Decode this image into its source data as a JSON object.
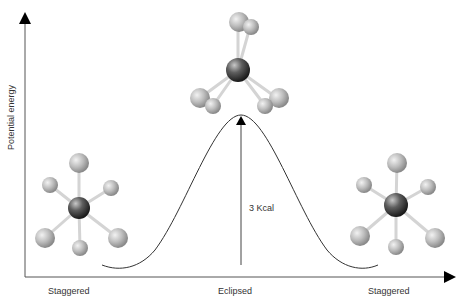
{
  "diagram": {
    "y_axis_label": "Potential energy",
    "x_labels": [
      "Staggered",
      "Eclipsed",
      "Staggered"
    ],
    "barrier_label": "3 Kcal",
    "molecules": [
      {
        "name": "staggered-left",
        "view": "Newman-like staggered"
      },
      {
        "name": "eclipsed-top",
        "view": "eclipsed side view"
      },
      {
        "name": "staggered-right",
        "view": "Newman-like staggered"
      }
    ],
    "colors": {
      "axis": "#000000",
      "curve": "#333333",
      "atom_hydrogen": "#b8b8b8",
      "atom_carbon": "#5a5a5a",
      "bond": "#d8d8d8"
    }
  }
}
